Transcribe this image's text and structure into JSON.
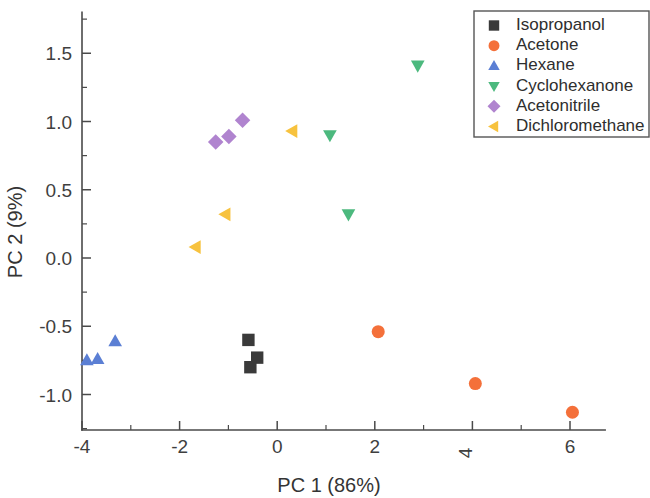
{
  "chart_data": {
    "type": "scatter",
    "title": "",
    "xlabel": "PC 1 (86%)",
    "ylabel": "PC 2 (9%)",
    "xlim": [
      -4.0,
      6.72
    ],
    "ylim": [
      -1.26,
      1.8
    ],
    "xticks": [
      -4,
      -2,
      0,
      2,
      4,
      6
    ],
    "xticklabels": [
      "-4",
      "-2",
      "0",
      "2",
      "∠",
      "6"
    ],
    "yticks": [
      -1.0,
      -0.5,
      0.0,
      0.5,
      1.0,
      1.5
    ],
    "yticklabels": [
      "-1.0",
      "-0.5",
      "0.0",
      "0.5",
      "1.0",
      "1.5"
    ],
    "xminorticks": [
      -3,
      -1,
      1,
      3,
      5
    ],
    "yminorticks": [
      -1.25,
      -0.75,
      -0.25,
      0.25,
      0.75,
      1.25,
      1.75
    ],
    "grid": false,
    "legend_position": "top-right",
    "series": [
      {
        "name": "Isopropanol",
        "marker": "square",
        "color": "#3a3a3a",
        "points": [
          {
            "x": -0.59,
            "y": -0.6
          },
          {
            "x": -0.41,
            "y": -0.73
          },
          {
            "x": -0.55,
            "y": -0.8
          }
        ]
      },
      {
        "name": "Acetone",
        "marker": "circle",
        "color": "#f4703a",
        "points": [
          {
            "x": 2.07,
            "y": -0.54
          },
          {
            "x": 4.06,
            "y": -0.92
          },
          {
            "x": 6.05,
            "y": -1.13
          }
        ]
      },
      {
        "name": "Hexane",
        "marker": "triangle-up",
        "color": "#5b7fd4",
        "points": [
          {
            "x": -3.9,
            "y": -0.75
          },
          {
            "x": -3.68,
            "y": -0.74
          },
          {
            "x": -3.32,
            "y": -0.61
          }
        ]
      },
      {
        "name": "Cyclohexanone",
        "marker": "triangle-down",
        "color": "#4cb97e",
        "points": [
          {
            "x": 2.88,
            "y": 1.41
          },
          {
            "x": 1.08,
            "y": 0.9
          },
          {
            "x": 1.46,
            "y": 0.32
          }
        ]
      },
      {
        "name": "Acetonitrile",
        "marker": "diamond",
        "color": "#b084cf",
        "points": [
          {
            "x": -1.26,
            "y": 0.85
          },
          {
            "x": -0.99,
            "y": 0.89
          },
          {
            "x": -0.71,
            "y": 1.01
          }
        ]
      },
      {
        "name": "Dichloromethane",
        "marker": "triangle-left",
        "color": "#f7c23e",
        "points": [
          {
            "x": 0.31,
            "y": 0.93
          },
          {
            "x": -1.06,
            "y": 0.32
          },
          {
            "x": -1.67,
            "y": 0.08
          }
        ]
      }
    ]
  },
  "legend": {
    "entries": [
      {
        "label": "Isopropanol"
      },
      {
        "label": "Acetone"
      },
      {
        "label": "Hexane"
      },
      {
        "label": "Cyclohexanone"
      },
      {
        "label": "Acetonitrile"
      },
      {
        "label": "Dichloromethane"
      }
    ]
  }
}
